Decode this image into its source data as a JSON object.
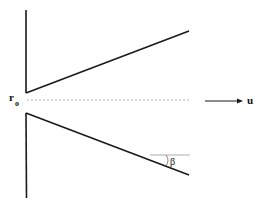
{
  "diagram": {
    "labels": {
      "radius": "r",
      "radius_subscript": "o",
      "velocity": "u",
      "angle": "β"
    },
    "colors": {
      "line": "#1a1a1a",
      "dashed_axis": "#9a9a9a",
      "reference_line": "#8a8a8a",
      "background": "#ffffff"
    }
  }
}
